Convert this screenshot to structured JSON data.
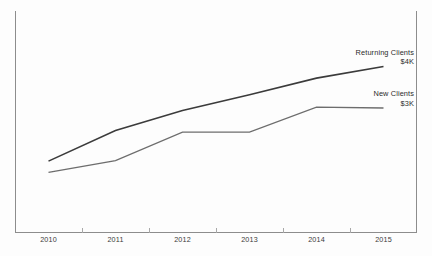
{
  "chart_data": {
    "type": "line",
    "title": "",
    "subtitle": "",
    "xlabel": "",
    "ylabel": "",
    "grid": false,
    "legend_position": "line-end-labels",
    "categories": [
      "2010",
      "2011",
      "2012",
      "2013",
      "2014",
      "2015"
    ],
    "x": [
      2010,
      2011,
      2012,
      2013,
      2014,
      2015
    ],
    "xlim": [
      2010,
      2015
    ],
    "ylim": [
      0,
      5
    ],
    "yunit": "$K",
    "series": [
      {
        "name": "Returning Clients",
        "end_value_label": "$4K",
        "color": "#3b3b3b",
        "stroke_width": 1.6,
        "values": [
          1.72,
          2.46,
          2.94,
          3.32,
          3.72,
          4.0
        ]
      },
      {
        "name": "New Clients",
        "end_value_label": "$3K",
        "color": "#6d6d6d",
        "stroke_width": 1.3,
        "values": [
          1.45,
          1.73,
          2.42,
          2.42,
          3.02,
          3.0
        ]
      }
    ],
    "axis": {
      "x_axis_color": "#8d8d8d",
      "y_axis_color": "#8d8d8d",
      "tick_color": "#a8a8a8",
      "x_tick_labels": [
        "2010",
        "2011",
        "2012",
        "2013",
        "2014",
        "2015"
      ],
      "y_tick_labels": []
    },
    "background_color": "#fdfdfd"
  }
}
